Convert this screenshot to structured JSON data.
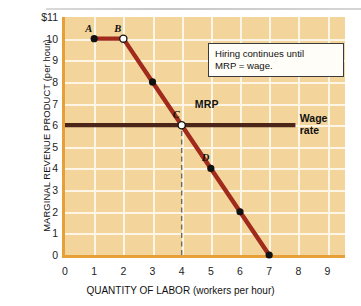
{
  "chart_data": {
    "type": "line",
    "title": "",
    "xlabel": "QUANTITY OF LABOR (workers per hour)",
    "ylabel": "MARGINAL REVENUE PRODUCT (per hour)",
    "xlim": [
      0,
      9.6
    ],
    "ylim": [
      0,
      11
    ],
    "xticks": [
      "0",
      "1",
      "2",
      "3",
      "4",
      "5",
      "6",
      "7",
      "8",
      "9"
    ],
    "yticks": [
      "0",
      "1",
      "2",
      "3",
      "4",
      "5",
      "6",
      "7",
      "8",
      "9",
      "10",
      "$11"
    ],
    "grid": true,
    "legend": "none",
    "series": [
      {
        "name": "MRP",
        "label": "MRP",
        "color": "#a02a1c",
        "x": [
          1,
          2,
          3,
          4,
          5,
          6,
          7
        ],
        "values": [
          10,
          10,
          8,
          6,
          4,
          2,
          0
        ],
        "markers": [
          {
            "point": "A",
            "x": 1,
            "y": 10,
            "style": "filled"
          },
          {
            "point": "B",
            "x": 2,
            "y": 10,
            "style": "open"
          },
          {
            "point": "",
            "x": 3,
            "y": 8,
            "style": "filled"
          },
          {
            "point": "C",
            "x": 4,
            "y": 6,
            "style": "open"
          },
          {
            "point": "D",
            "x": 5,
            "y": 4,
            "style": "filled"
          },
          {
            "point": "",
            "x": 6,
            "y": 2,
            "style": "filled"
          },
          {
            "point": "",
            "x": 7,
            "y": 0,
            "style": "filled"
          }
        ]
      },
      {
        "name": "Wage rate",
        "label": "Wage rate",
        "label_line1": "Wage",
        "label_line2": "rate",
        "color": "#4a2518",
        "type": "horizontal-line",
        "y": 6,
        "x_start": 0,
        "x_end": 7.9
      }
    ],
    "reference_lines": [
      {
        "name": "equilibrium-quantity",
        "orientation": "vertical",
        "x": 4,
        "y_from": 0,
        "y_to": 6,
        "style": "dashed",
        "color": "#6f6a5c"
      }
    ],
    "annotations": [
      {
        "name": "hiring-rule-callout",
        "line1": "Hiring continues until",
        "line2": "MRP  =  wage."
      }
    ],
    "colors": {
      "panel_background": "#f3d59c",
      "grid": "#fdf6e6",
      "axis_border": "#e79f37",
      "mrp_line": "#a02a1c",
      "wage_line": "#4a2518",
      "dashed_line": "#6f6a5c",
      "page_background": "#ffffff"
    }
  }
}
